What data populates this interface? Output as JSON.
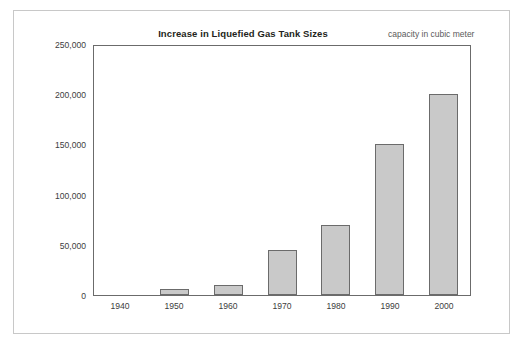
{
  "chart_data": {
    "type": "bar",
    "title": "Increase in Liquefied Gas Tank Sizes",
    "subtitle": "capacity in cubic meter",
    "xlabel": "",
    "ylabel": "",
    "categories": [
      "1940",
      "1950",
      "1960",
      "1970",
      "1980",
      "1990",
      "2000"
    ],
    "values": [
      0,
      6000,
      10000,
      45000,
      70000,
      150000,
      200000
    ],
    "ylim": [
      0,
      250000
    ],
    "yticks": [
      0,
      50000,
      100000,
      150000,
      200000,
      250000
    ],
    "ytick_labels": [
      "0",
      "50,000",
      "100,000",
      "150,000",
      "200,000",
      "250,000"
    ],
    "grid": false,
    "legend": false,
    "bar_color": "#c9c9c9",
    "bar_edge_color": "#6b6b6b",
    "axis_color": "#6b6b6b",
    "frame_color": "#c8c8c8",
    "text_color": "#3d3d3d",
    "subtitle_color": "#5b5b5b"
  }
}
